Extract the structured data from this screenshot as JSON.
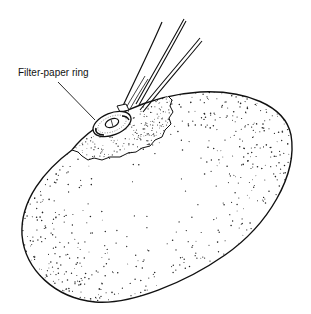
{
  "figure": {
    "labels": [
      {
        "text": "Filter-paper ring",
        "target": "filter-paper-ring"
      }
    ],
    "colors": {
      "line": "#111111",
      "stipple": "#222222",
      "background": "#ffffff"
    }
  }
}
